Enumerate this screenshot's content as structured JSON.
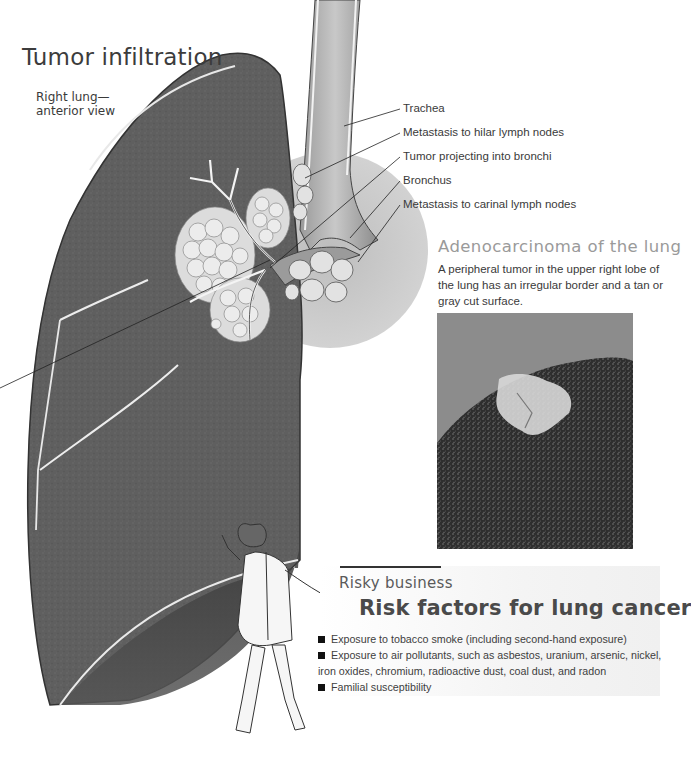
{
  "header": {
    "title": "Tumor infiltration",
    "subtitle": "Right lung—\nanterior view"
  },
  "diagram": {
    "labels": [
      {
        "text": "Trachea"
      },
      {
        "text": "Metastasis to hilar lymph nodes"
      },
      {
        "text": "Tumor projecting into bronchi"
      },
      {
        "text": "Bronchus"
      },
      {
        "text": "Metastasis to carinal lymph nodes"
      }
    ]
  },
  "adenocarcinoma": {
    "title": "Adenocarcinoma of the lung",
    "description": "A peripheral tumor in the upper right lobe of the lung has an irregular border and a tan or gray cut surface."
  },
  "risk_section": {
    "kicker": "Risky business",
    "title": "Risk factors for lung cancer",
    "items": [
      {
        "text": "Exposure to tobacco smoke (including second-hand exposure)"
      },
      {
        "text": "Exposure to air pollutants, such as asbestos, uranium, arsenic, nickel, iron oxides, chromium, radioactive dust, coal dust, and radon"
      },
      {
        "text": "Familial susceptibility"
      }
    ]
  },
  "colors": {
    "lung_tissue": "#5e5e5e",
    "tumor": "#e6e6e6",
    "background": "#ffffff",
    "heading_text": "#3c3c3c",
    "muted_heading": "#9a9a9a"
  }
}
